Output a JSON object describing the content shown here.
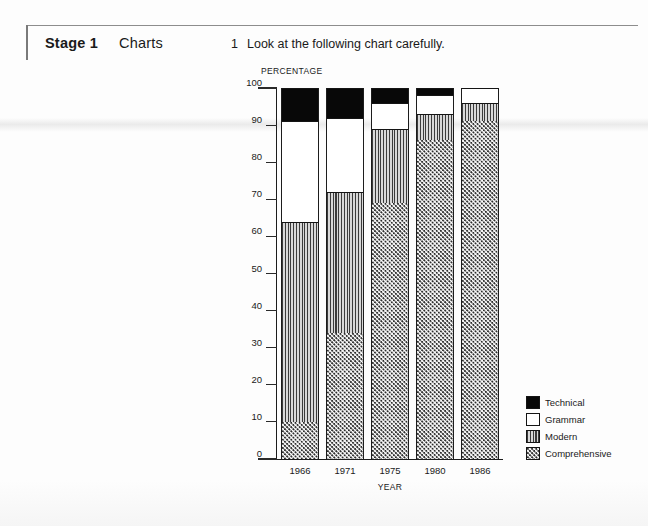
{
  "header": {
    "stage": "Stage 1",
    "section": "Charts",
    "question_number": "1",
    "question_text": "Look at the following chart carefully."
  },
  "chart_data": {
    "type": "bar",
    "subtype": "stacked-percentage-column",
    "title": "",
    "xlabel": "YEAR",
    "ylabel": "PERCENTAGE",
    "categories": [
      "1966",
      "1971",
      "1975",
      "1980",
      "1986"
    ],
    "ylim": [
      0,
      100
    ],
    "yticks": [
      0,
      10,
      20,
      30,
      40,
      50,
      60,
      70,
      80,
      90,
      100
    ],
    "grid": false,
    "legend_position": "right",
    "series": [
      {
        "name": "Comprehensive",
        "pattern": "dotted",
        "color": "#ffffff",
        "values": [
          10,
          34,
          69,
          86,
          91
        ]
      },
      {
        "name": "Modern",
        "pattern": "vertical-lines",
        "color": "#8a8a8a",
        "values": [
          54,
          38,
          20,
          7,
          5
        ]
      },
      {
        "name": "Grammar",
        "pattern": "solid-white",
        "color": "#ffffff",
        "values": [
          27,
          20,
          7,
          5,
          4
        ]
      },
      {
        "name": "Technical",
        "pattern": "solid-black",
        "color": "#080808",
        "values": [
          9,
          8,
          4,
          2,
          0
        ]
      }
    ],
    "cumulative_tops": {
      "1966": {
        "Comprehensive": 10,
        "Modern": 64,
        "Grammar": 91,
        "Technical": 100
      },
      "1971": {
        "Comprehensive": 34,
        "Modern": 72,
        "Grammar": 92,
        "Technical": 100
      },
      "1975": {
        "Comprehensive": 69,
        "Modern": 89,
        "Grammar": 96,
        "Technical": 100
      },
      "1980": {
        "Comprehensive": 86,
        "Modern": 93,
        "Grammar": 98,
        "Technical": 100
      },
      "1986": {
        "Comprehensive": 91,
        "Modern": 96,
        "Grammar": 100,
        "Technical": 100
      }
    },
    "legend": [
      {
        "label": "Technical",
        "pattern": "solid-black"
      },
      {
        "label": "Grammar",
        "pattern": "solid-white"
      },
      {
        "label": "Modern",
        "pattern": "vertical-lines"
      },
      {
        "label": "Comprehensive",
        "pattern": "dotted"
      }
    ]
  }
}
